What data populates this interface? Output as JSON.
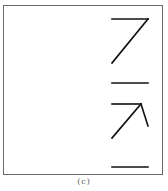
{
  "figure": {
    "caption": "(c)",
    "stroke_color": "#111111",
    "frame_color": "#6a6a6a"
  },
  "symbols": [
    {
      "name": "seven-shape",
      "description": "horizontal top bar with diagonal stroke down-left"
    },
    {
      "name": "horizontal-bar-1",
      "description": "short horizontal line"
    },
    {
      "name": "arrow-shape",
      "description": "horizontal bar with diagonal stroke and short tail (arrow-like)"
    },
    {
      "name": "horizontal-bar-2",
      "description": "short horizontal line"
    }
  ]
}
